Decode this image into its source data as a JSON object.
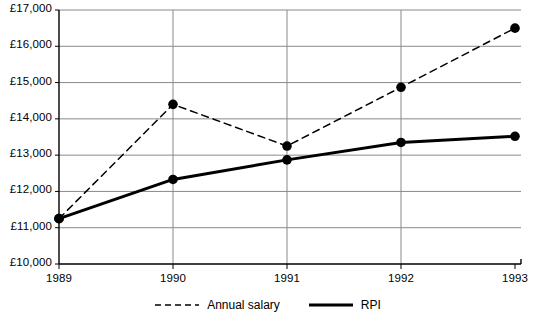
{
  "chart_data": {
    "type": "line",
    "title": "",
    "subtitle": "",
    "xlabel": "",
    "ylabel": "",
    "categories": [
      "1989",
      "1990",
      "1991",
      "1992",
      "1993"
    ],
    "x": [
      1989,
      1990,
      1991,
      1992,
      1993
    ],
    "ylim": [
      10000,
      17000
    ],
    "ytick_values": [
      10000,
      11000,
      12000,
      13000,
      14000,
      15000,
      16000,
      17000
    ],
    "ytick_labels": [
      "£10,000",
      "£11,000",
      "£12,000",
      "£13,000",
      "£14,000",
      "£15,000",
      "£16,000",
      "£17,000"
    ],
    "xtick_labels": [
      "1989",
      "1990",
      "1991",
      "1992",
      "1993"
    ],
    "grid": "horizontal",
    "legend_position": "bottom-center",
    "currency_symbol": "£",
    "series": [
      {
        "name": "Annual salary",
        "style": "dashed",
        "marker": "filled-circle",
        "color": "#000000",
        "values": [
          11250,
          14400,
          13250,
          14870,
          16500
        ]
      },
      {
        "name": "RPI",
        "style": "solid",
        "marker": "filled-circle",
        "color": "#000000",
        "values": [
          11250,
          12330,
          12870,
          13350,
          13520
        ]
      }
    ]
  },
  "legend": {
    "items": [
      {
        "label": "Annual salary",
        "style": "dashed"
      },
      {
        "label": "RPI",
        "style": "solid"
      }
    ]
  },
  "colors": {
    "axis": "#000000",
    "gridline": "#8a8a8a",
    "line": "#000000",
    "background": "#ffffff"
  }
}
